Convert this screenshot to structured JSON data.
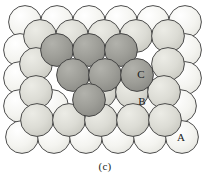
{
  "figure": {
    "caption": "(c)",
    "canvas": {
      "width": 210,
      "height": 190
    },
    "plot_area": {
      "width": 210,
      "height": 160
    }
  },
  "style": {
    "background": "#ffffff",
    "stroke": "#3a3a3a",
    "stroke_width": 0.9,
    "sphere_radius": 16.4
  },
  "layers": [
    {
      "id": "A",
      "name": "layer-a-bottom",
      "label": "A",
      "fill": "#f2f2ee",
      "highlight": "#fbfbf8",
      "description": "bottom close-packed layer"
    },
    {
      "id": "B",
      "name": "layer-b-middle",
      "label": "B",
      "fill": "#d9d9d2",
      "highlight": "#e8e8e2",
      "description": "second close-packed layer seated in A hollows"
    },
    {
      "id": "C",
      "name": "layer-c-top",
      "label": "C",
      "fill": "#9a9a95",
      "highlight": "#acaca6",
      "description": "third close-packed layer in the remaining C hollows"
    }
  ],
  "labels": [
    {
      "text": "A",
      "x": 181,
      "y": 137,
      "layer": "A"
    },
    {
      "text": "B",
      "x": 142,
      "y": 101,
      "layer": "B"
    },
    {
      "text": "C",
      "x": 141,
      "y": 74,
      "layer": "C"
    }
  ],
  "spheres": {
    "A": [
      {
        "cx": 25,
        "cy": 22
      },
      {
        "cx": 57,
        "cy": 22
      },
      {
        "cx": 89,
        "cy": 22
      },
      {
        "cx": 121,
        "cy": 22
      },
      {
        "cx": 153,
        "cy": 22
      },
      {
        "cx": 185,
        "cy": 22
      },
      {
        "cx": 20,
        "cy": 50
      },
      {
        "cx": 185,
        "cy": 50
      },
      {
        "cx": 20,
        "cy": 78
      },
      {
        "cx": 185,
        "cy": 78
      },
      {
        "cx": 20,
        "cy": 106
      },
      {
        "cx": 52,
        "cy": 106
      },
      {
        "cx": 116,
        "cy": 106
      },
      {
        "cx": 148,
        "cy": 106
      },
      {
        "cx": 180,
        "cy": 106
      },
      {
        "cx": 22,
        "cy": 137
      },
      {
        "cx": 54,
        "cy": 137
      },
      {
        "cx": 86,
        "cy": 137
      },
      {
        "cx": 118,
        "cy": 137
      },
      {
        "cx": 150,
        "cy": 137
      },
      {
        "cx": 182,
        "cy": 137
      }
    ],
    "B": [
      {
        "cx": 40,
        "cy": 36
      },
      {
        "cx": 72,
        "cy": 36
      },
      {
        "cx": 104,
        "cy": 36
      },
      {
        "cx": 136,
        "cy": 36
      },
      {
        "cx": 168,
        "cy": 36
      },
      {
        "cx": 36,
        "cy": 64
      },
      {
        "cx": 168,
        "cy": 64
      },
      {
        "cx": 36,
        "cy": 92
      },
      {
        "cx": 100,
        "cy": 92
      },
      {
        "cx": 132,
        "cy": 92
      },
      {
        "cx": 164,
        "cy": 92
      },
      {
        "cx": 37,
        "cy": 120
      },
      {
        "cx": 69,
        "cy": 120
      },
      {
        "cx": 101,
        "cy": 120
      },
      {
        "cx": 133,
        "cy": 120
      },
      {
        "cx": 165,
        "cy": 120
      }
    ],
    "C": [
      {
        "cx": 57,
        "cy": 50
      },
      {
        "cx": 89,
        "cy": 50
      },
      {
        "cx": 121,
        "cy": 50
      },
      {
        "cx": 73,
        "cy": 75
      },
      {
        "cx": 105,
        "cy": 75
      },
      {
        "cx": 137,
        "cy": 75
      },
      {
        "cx": 89,
        "cy": 100
      }
    ]
  }
}
